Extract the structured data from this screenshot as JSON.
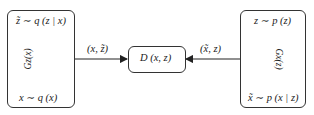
{
  "diagram": {
    "encoder_box": {
      "top_label": "z̃ ∼ q (z | x)",
      "bottom_label": "x ∼ q (x)",
      "arrow_label": "Gz(x)"
    },
    "generator_box": {
      "top_label": "z ∼ p (z)",
      "bottom_label": "x̃ ∼ p (x | z)",
      "arrow_label": "Gx(z)"
    },
    "discriminator_box": {
      "label": "D (x, z)"
    },
    "edges": [
      {
        "from": "encoder_box",
        "to": "discriminator_box",
        "label": "(x, z̃)"
      },
      {
        "from": "generator_box",
        "to": "discriminator_box",
        "label": "(x̃, z)"
      }
    ],
    "colors": {
      "stroke": "#333333",
      "background": "#ffffff"
    }
  }
}
